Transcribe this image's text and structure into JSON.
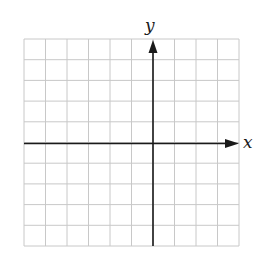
{
  "diagram": {
    "type": "coordinate-grid",
    "x_axis_label": "x",
    "y_axis_label": "y",
    "grid": {
      "columns": 10,
      "rows": 10,
      "columns_left_of_y_axis": 6,
      "rows_above_x_axis": 5,
      "tick_labels": "none"
    },
    "colors": {
      "grid_line": "#c8c8c8",
      "axis": "#1a1a1a",
      "background": "#ffffff"
    }
  }
}
